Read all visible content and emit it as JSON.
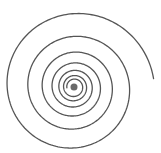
{
  "figure": {
    "type": "logarithmic-spiral",
    "background": "#ffffff",
    "stroke_color": "#555555",
    "center_fill": "#444444",
    "center": [
      74,
      87
    ],
    "outer_radius": 80,
    "end_angle_deg": -6,
    "turns": 6.5,
    "growth_per_turn": 1.45,
    "stroke_width": 1.3
  }
}
